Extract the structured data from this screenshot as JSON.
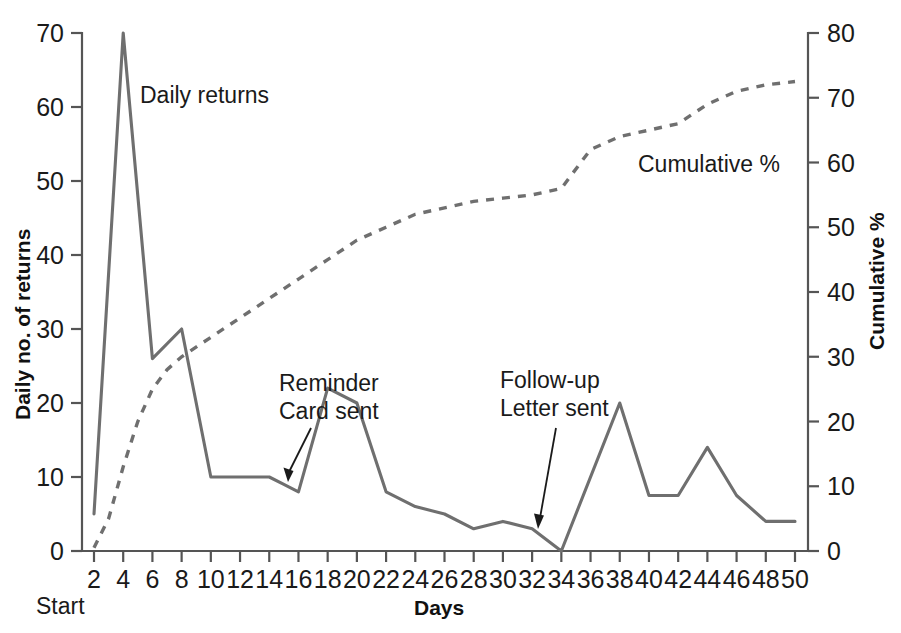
{
  "chart_data": {
    "type": "line",
    "title": "",
    "xlabel": "Days",
    "ylabel": "Daily no. of returns",
    "y2label": "Cumulative %",
    "xlim": [
      0,
      51
    ],
    "ylim": [
      0,
      70
    ],
    "y2lim": [
      0,
      80
    ],
    "grid": false,
    "legend_position": "inline-annotations",
    "x_tick_labels": [
      "2",
      "4",
      "6",
      "8",
      "10",
      "12",
      "14",
      "16",
      "18",
      "20",
      "22",
      "24",
      "26",
      "28",
      "30",
      "32",
      "34",
      "36",
      "38",
      "40",
      "42",
      "44",
      "46",
      "48",
      "50"
    ],
    "x_tick_values": [
      2,
      4,
      6,
      8,
      10,
      12,
      14,
      16,
      18,
      20,
      22,
      24,
      26,
      28,
      30,
      32,
      34,
      36,
      38,
      40,
      42,
      44,
      46,
      48,
      50
    ],
    "y_tick_labels": [
      "0",
      "10",
      "20",
      "30",
      "40",
      "50",
      "60",
      "70"
    ],
    "y_tick_values": [
      0,
      10,
      20,
      30,
      40,
      50,
      60,
      70
    ],
    "y2_tick_labels": [
      "0",
      "10",
      "20",
      "30",
      "40",
      "50",
      "60",
      "70",
      "80"
    ],
    "y2_tick_values": [
      0,
      10,
      20,
      30,
      40,
      50,
      60,
      70,
      80
    ],
    "axis_origin_note": "Start",
    "series": [
      {
        "name": "Daily returns",
        "style": "solid",
        "color": "#6f6f6f",
        "axis": "left",
        "x": [
          2,
          4,
          6,
          8,
          10,
          12,
          14,
          15,
          16,
          18,
          20,
          22,
          24,
          26,
          28,
          30,
          32,
          34,
          38,
          40,
          42,
          44,
          46,
          48,
          50
        ],
        "values": [
          5,
          70,
          26,
          30,
          10,
          10,
          10,
          9,
          8,
          22,
          20,
          8,
          6,
          5,
          3,
          4,
          3,
          0,
          20,
          7.5,
          7.5,
          14,
          7.5,
          4,
          4
        ]
      },
      {
        "name": "Cumulative %",
        "style": "dashed",
        "color": "#6f6f6f",
        "axis": "right",
        "x": [
          2,
          3,
          4,
          5,
          6,
          7,
          8,
          10,
          12,
          14,
          16,
          18,
          20,
          22,
          24,
          26,
          28,
          30,
          32,
          34,
          36,
          38,
          40,
          42,
          44,
          46,
          48,
          50
        ],
        "values": [
          0.5,
          5,
          13,
          20,
          25,
          28,
          30,
          33,
          36,
          39,
          42,
          45,
          48,
          50,
          52,
          53,
          54,
          54.5,
          55,
          56,
          62,
          64,
          65,
          66,
          69,
          71,
          72,
          72.5
        ]
      }
    ],
    "annotations": [
      {
        "label_line1": "Reminder",
        "label_line2": "Card sent",
        "target_x": 15,
        "target_y": 9,
        "target_axis": "left"
      },
      {
        "label_line1": "Follow-up",
        "label_line2": "Letter sent",
        "target_x": 32,
        "target_y": 3,
        "target_axis": "left"
      }
    ],
    "series_labels": [
      {
        "text": "Daily returns",
        "x": 8.5,
        "y": 62,
        "axis": "left"
      },
      {
        "text": "Cumulative %",
        "x": 36.5,
        "y": 59.5,
        "axis": "right"
      }
    ]
  },
  "colors": {
    "series_gray": "#6f6f6f",
    "axis_gray": "#555555",
    "text_black": "#1a1a1a",
    "background": "#ffffff"
  }
}
